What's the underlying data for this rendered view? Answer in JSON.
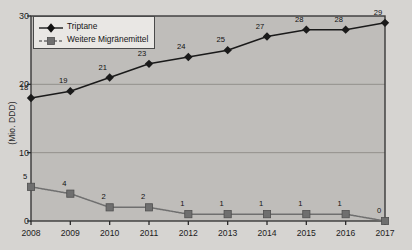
{
  "chart_data": {
    "type": "line",
    "title": "",
    "xlabel": "",
    "ylabel": "(Mio. DDD)",
    "categories": [
      "2008",
      "2009",
      "2010",
      "2011",
      "2012",
      "2013",
      "2014",
      "2015",
      "2016",
      "2017"
    ],
    "x": [
      2008,
      2009,
      2010,
      2011,
      2012,
      2013,
      2014,
      2015,
      2016,
      2017
    ],
    "ylim": [
      0,
      30
    ],
    "yticks": [
      0,
      10,
      20,
      30
    ],
    "grid": true,
    "legend_position": "top-left",
    "series": [
      {
        "name": "Triptane",
        "marker": "diamond",
        "color": "#1a1a1a",
        "line_style": "solid",
        "values": [
          18,
          19,
          21,
          23,
          24,
          25,
          27,
          28,
          28,
          29
        ],
        "labels": [
          "18",
          "19",
          "21",
          "23",
          "24",
          "25",
          "27",
          "28",
          "28",
          "29"
        ]
      },
      {
        "name": "Weitere Migränemittel",
        "marker": "square",
        "color": "#6f6f6f",
        "line_style": "dashed",
        "values": [
          5,
          4,
          2,
          2,
          1,
          1,
          1,
          1,
          1,
          0
        ],
        "labels": [
          "5",
          "4",
          "2",
          "2",
          "1",
          "1",
          "1",
          "1",
          "1",
          "0"
        ]
      }
    ]
  },
  "axis": {
    "y_label": "(Mio. DDD)",
    "y_ticks": [
      "0",
      "10",
      "20",
      "30"
    ],
    "x_ticks": [
      "2008",
      "2009",
      "2010",
      "2011",
      "2012",
      "2013",
      "2014",
      "2015",
      "2016",
      "2017"
    ]
  },
  "legend": {
    "items": [
      {
        "label": "Triptane"
      },
      {
        "label": "Weitere Migränemittel"
      }
    ]
  },
  "colors": {
    "background": "#d6d4d1",
    "plot_area": "#bfbdba",
    "series_1": "#1a1a1a",
    "series_2": "#6f6f6f",
    "axis": "#2b2b2b",
    "grid": "#8d8b88"
  }
}
